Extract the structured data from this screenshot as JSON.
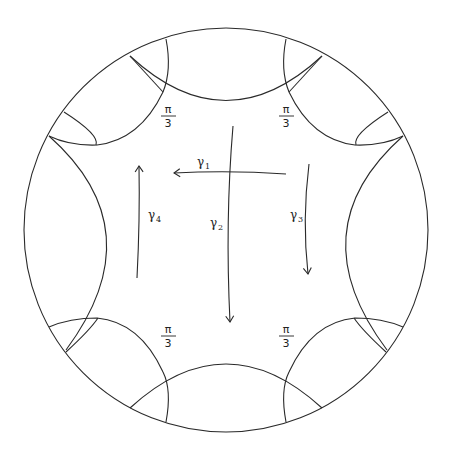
{
  "figure": {
    "angle_labels": [
      {
        "num": "π",
        "den": "3",
        "position": "top-left"
      },
      {
        "num": "π",
        "den": "3",
        "position": "top-right"
      },
      {
        "num": "π",
        "den": "3",
        "position": "bottom-left"
      },
      {
        "num": "π",
        "den": "3",
        "position": "bottom-right"
      }
    ],
    "curves": [
      {
        "name": "γ",
        "sub": "1",
        "direction": "leftward"
      },
      {
        "name": "γ",
        "sub": "2",
        "direction": "downward"
      },
      {
        "name": "γ",
        "sub": "3",
        "direction": "downward"
      },
      {
        "name": "γ",
        "sub": "4",
        "direction": "upward"
      }
    ]
  }
}
